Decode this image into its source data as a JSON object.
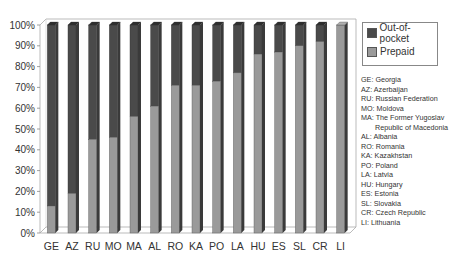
{
  "chart_data": {
    "type": "bar",
    "stacked": true,
    "percent": true,
    "title": "",
    "xlabel": "",
    "ylabel": "",
    "ylim": [
      0,
      100
    ],
    "yticks": [
      "0%",
      "10%",
      "20%",
      "30%",
      "40%",
      "50%",
      "60%",
      "70%",
      "80%",
      "90%",
      "100%"
    ],
    "categories": [
      "GE",
      "AZ",
      "RU",
      "MO",
      "MA",
      "AL",
      "RO",
      "KA",
      "PO",
      "LA",
      "HU",
      "ES",
      "SL",
      "CR",
      "LI"
    ],
    "series": [
      {
        "name": "Prepaid",
        "color": "#9a9a9a",
        "values": [
          13,
          19,
          45,
          46,
          56,
          61,
          71,
          71,
          73,
          77,
          86,
          87,
          90,
          92,
          100
        ]
      },
      {
        "name": "Out-of-pocket",
        "color": "#4a4a4a",
        "values": [
          87,
          81,
          55,
          54,
          44,
          39,
          29,
          29,
          27,
          23,
          14,
          13,
          10,
          8,
          0
        ]
      }
    ],
    "legend": {
      "position": "right",
      "entries": [
        "Out-of-pocket",
        "Prepaid"
      ]
    },
    "grid": false,
    "annotations": [
      "GE: Georgia",
      "AZ: Azerbaijan",
      "RU: Russian Federation",
      "MO: Moldova",
      "MA: The Former Yugoslav Republic of Macedonia",
      "AL: Albania",
      "RO: Romania",
      "KA: Kazakhstan",
      "PO: Poland",
      "LA: Latvia",
      "HU: Hungary",
      "ES: Estonia",
      "SL: Slovakia",
      "CR: Czech Republic",
      "LI: Lithuania"
    ]
  },
  "legend": {
    "items": [
      {
        "label": "Out-of-pocket",
        "color": "#4a4a4a"
      },
      {
        "label": "Prepaid",
        "color": "#9a9a9a"
      }
    ]
  },
  "abbreviations": {
    "lines": [
      "GE: Georgia",
      "AZ: Azerbaijan",
      "RU: Russian Federation",
      "MO: Moldova",
      "MA: The Former Yugoslav",
      "Republic of Macedonia",
      "AL: Albania",
      "RO: Romania",
      "KA: Kazakhstan",
      "PO: Poland",
      "LA: Latvia",
      "HU: Hungary",
      "ES: Estonia",
      "SL: Slovakia",
      "CR: Czech Republic",
      "LI: Lithuania"
    ]
  }
}
